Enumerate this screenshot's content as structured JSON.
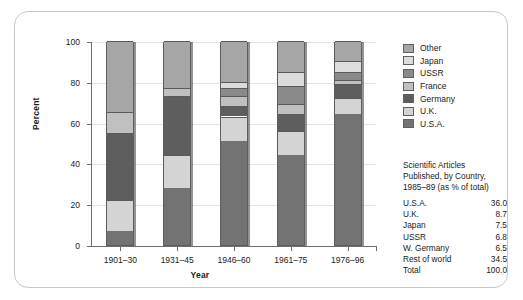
{
  "chart_data": {
    "type": "bar",
    "title": "",
    "xlabel": "Year",
    "ylabel": "Percent",
    "ylim": [
      0,
      100
    ],
    "yticks": [
      0,
      20,
      40,
      60,
      80,
      100
    ],
    "grid": true,
    "stacked": true,
    "legend_position": "right",
    "categories": [
      "1901–30",
      "1931–45",
      "1946–60",
      "1961–75",
      "1976–96"
    ],
    "series": [
      {
        "name": "U.S.A.",
        "color": "#737373",
        "values": [
          7,
          28,
          51,
          44,
          64
        ]
      },
      {
        "name": "U.K.",
        "color": "#d4d4d4",
        "values": [
          15,
          16,
          12,
          12,
          8
        ]
      },
      {
        "name": "Germany",
        "color": "#5e5e5e",
        "values": [
          33,
          29,
          5,
          8,
          7
        ]
      },
      {
        "name": "France",
        "color": "#c0c0c0",
        "values": [
          10,
          4,
          5,
          5,
          2
        ]
      },
      {
        "name": "USSR",
        "color": "#8a8a8a",
        "values": [
          0,
          0,
          4,
          9,
          4
        ]
      },
      {
        "name": "Japan",
        "color": "#dcdcdc",
        "values": [
          0,
          0,
          3,
          7,
          5
        ]
      },
      {
        "name": "Other",
        "color": "#a6a6a6",
        "values": [
          35,
          23,
          20,
          15,
          10
        ]
      }
    ],
    "legend_order": [
      "Other",
      "Japan",
      "USSR",
      "France",
      "Germany",
      "U.K.",
      "U.S.A."
    ]
  },
  "legend": {
    "items": [
      {
        "label": "Other",
        "color": "#a6a6a6"
      },
      {
        "label": "Japan",
        "color": "#dcdcdc"
      },
      {
        "label": "USSR",
        "color": "#8a8a8a"
      },
      {
        "label": "France",
        "color": "#c0c0c0"
      },
      {
        "label": "Germany",
        "color": "#5e5e5e"
      },
      {
        "label": "U.K.",
        "color": "#d4d4d4"
      },
      {
        "label": "U.S.A.",
        "color": "#737373"
      }
    ]
  },
  "caption": {
    "lines": [
      "Scientific Articles",
      "Published, by Country,",
      "1985–89 (as % of total)"
    ]
  },
  "table": {
    "rows": [
      {
        "name": "U.S.A.",
        "value": "36.0"
      },
      {
        "name": "U.K.",
        "value": "8.7"
      },
      {
        "name": "Japan",
        "value": "7.5"
      },
      {
        "name": "USSR",
        "value": "6.8"
      },
      {
        "name": "W. Germany",
        "value": "6.5"
      },
      {
        "name": "Rest of world",
        "value": "34.5"
      },
      {
        "name": "Total",
        "value": "100.0"
      }
    ]
  }
}
